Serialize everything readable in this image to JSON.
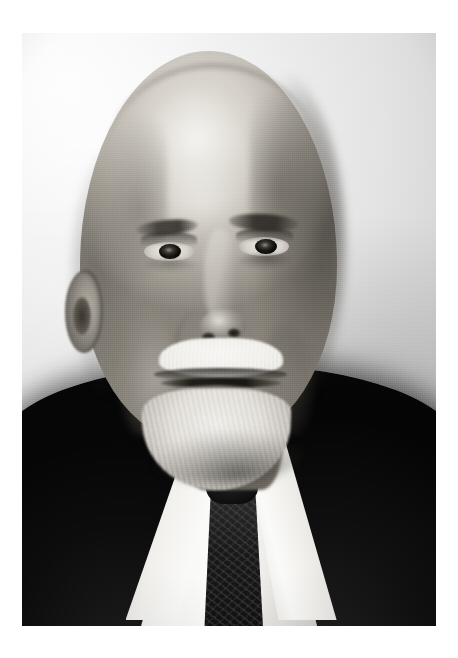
{
  "document": {
    "type": "photograph",
    "medium": "black-and-white studio portrait",
    "orientation": "portrait",
    "border": "white paper margin",
    "title": ""
  },
  "canvas": {
    "width_px": 458,
    "height_px": 658,
    "background_color": "#ffffff"
  },
  "photo": {
    "left_px": 22,
    "top_px": 33,
    "width_px": 414,
    "height_px": 593,
    "subject": "elderly bald man with white mustache and goatee beard",
    "alt_text": "Monochrome studio portrait of an elderly balding man with a short white mustache and pointed goatee beard, wearing a dark suit jacket, white shirt and dark patterned necktie, photographed against a plain light grey backdrop."
  },
  "palette": {
    "paper_white": "#ffffff",
    "backdrop_light": "#fbfbfb",
    "backdrop_mid": "#e4e4e4",
    "backdrop_dark": "#bdbdbd",
    "skin_highlight": "#e9e6df",
    "skin_mid": "#b9b4ab",
    "skin_shadow": "#8a857c",
    "beard_white": "#f3f1ec",
    "shirt_white": "#fdfdfb",
    "suit_black": "#0a0a0a",
    "tie_black": "#191919",
    "eye_dark": "#16150f"
  },
  "regions": [
    {
      "name": "backdrop",
      "label": "studio backdrop"
    },
    {
      "name": "head",
      "label": "head and bald crown"
    },
    {
      "name": "hair-fringe",
      "label": "side hair fringe"
    },
    {
      "name": "ear",
      "label": "left ear"
    },
    {
      "name": "eyes",
      "label": "eyes"
    },
    {
      "name": "brows",
      "label": "eyebrows"
    },
    {
      "name": "nose",
      "label": "nose"
    },
    {
      "name": "mustache",
      "label": "white mustache"
    },
    {
      "name": "beard",
      "label": "white goatee beard"
    },
    {
      "name": "neck",
      "label": "neck"
    },
    {
      "name": "shirt",
      "label": "white shirt and collar"
    },
    {
      "name": "tie",
      "label": "dark patterned necktie"
    },
    {
      "name": "suit",
      "label": "dark suit jacket"
    }
  ]
}
